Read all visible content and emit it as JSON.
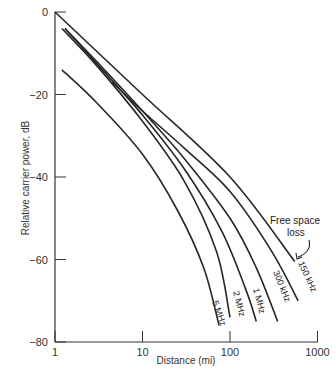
{
  "chart_data": {
    "type": "line",
    "title": "",
    "xlabel": "Distance (mi)",
    "ylabel": "Relative carrier power, dB",
    "xscale": "log",
    "xlim": [
      1,
      1000
    ],
    "ylim": [
      -80,
      0
    ],
    "x_ticks": [
      "1",
      "10",
      "100",
      "1000"
    ],
    "y_ticks": [
      "0",
      "-20",
      "-40",
      "-60",
      "-80"
    ],
    "grid": false,
    "annotations": [
      {
        "text_line1": "Free space",
        "text_line2": "loss",
        "points_to": "Free space loss"
      }
    ],
    "series": [
      {
        "name": "Free space loss",
        "x": [
          1,
          10,
          100,
          550
        ],
        "y": [
          0,
          -20,
          -40,
          -60.5
        ]
      },
      {
        "name": "150 kHz",
        "x": [
          4.5,
          10,
          30,
          100,
          300,
          600
        ],
        "y": [
          -17,
          -24,
          -33,
          -43.5,
          -58,
          -70
        ]
      },
      {
        "name": "300 kHz",
        "x": [
          1.3,
          3,
          10,
          30,
          100,
          200,
          350
        ],
        "y": [
          -4,
          -12,
          -24,
          -35.5,
          -50,
          -62,
          -75
        ]
      },
      {
        "name": "1 MHz",
        "x": [
          1.3,
          3,
          10,
          30,
          80,
          150,
          200
        ],
        "y": [
          -4,
          -12.5,
          -25,
          -38,
          -53,
          -67,
          -75
        ]
      },
      {
        "name": "2 MHz",
        "x": [
          1.2,
          3,
          10,
          30,
          70,
          100
        ],
        "y": [
          -4,
          -13,
          -26.5,
          -41,
          -58,
          -74
        ]
      },
      {
        "name": "5 MHz",
        "x": [
          1.2,
          3,
          10,
          25,
          50,
          75
        ],
        "y": [
          -14,
          -22,
          -34.5,
          -48,
          -62,
          -76
        ]
      }
    ]
  },
  "labels": {
    "series": [
      "5 MHz",
      "2 MHz",
      "1 MHz",
      "300 kHz",
      "150 kHz"
    ],
    "free_space_1": "Free space",
    "free_space_2": "loss"
  }
}
